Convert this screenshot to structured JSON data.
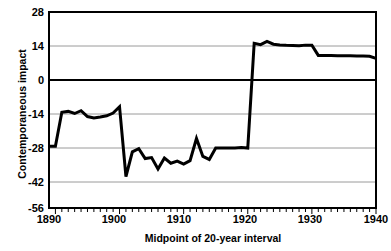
{
  "chart_data": {
    "type": "line",
    "title": "",
    "xlabel": "Midpoint of 20-year interval",
    "ylabel": "Contemporaneous impact",
    "xlim": [
      1889,
      1940
    ],
    "ylim": [
      -56,
      28
    ],
    "yticks": [
      28,
      14,
      0,
      -14,
      -28,
      -42,
      -56
    ],
    "xticks": [
      1890,
      1900,
      1910,
      1920,
      1930,
      1940
    ],
    "xtick_minor_step": 1,
    "grid": true,
    "legend": "none",
    "series": [
      {
        "name": "Contemporaneous impact",
        "x": [
          1889,
          1890,
          1891,
          1892,
          1893,
          1894,
          1895,
          1896,
          1897,
          1898,
          1899,
          1900,
          1901,
          1902,
          1903,
          1904,
          1905,
          1906,
          1907,
          1908,
          1909,
          1910,
          1911,
          1912,
          1913,
          1914,
          1915,
          1916,
          1917,
          1918,
          1919,
          1920,
          1921,
          1922,
          1923,
          1924,
          1925,
          1926,
          1927,
          1928,
          1929,
          1930,
          1931,
          1932,
          1933,
          1934,
          1935,
          1936,
          1937,
          1938,
          1939,
          1940
        ],
        "y": [
          -29.5,
          -29.5,
          -15.0,
          -14.6,
          -15.5,
          -14.3,
          -16.8,
          -17.4,
          -17.0,
          -16.5,
          -15.3,
          -12.6,
          -42.5,
          -31.9,
          -30.6,
          -34.8,
          -34.4,
          -39.3,
          -34.6,
          -36.8,
          -35.9,
          -37.2,
          -35.7,
          -26.2,
          -33.9,
          -35.2,
          -30.3,
          -30.3,
          -30.3,
          -30.3,
          -30.1,
          -30.3,
          14.6,
          14.0,
          15.4,
          14.2,
          13.9,
          13.7,
          13.6,
          13.5,
          13.8,
          13.8,
          9.4,
          9.4,
          9.4,
          9.3,
          9.2,
          9.2,
          9.1,
          9.1,
          9.0,
          8.1
        ]
      }
    ]
  },
  "axis": {
    "y_tick_labels": [
      "28",
      "14",
      "0",
      "-14",
      "-28",
      "-42",
      "-56"
    ],
    "x_tick_labels": [
      "1890",
      "1900",
      "1910",
      "1920",
      "1930",
      "1940"
    ],
    "y_title": "Contemporaneous impact",
    "x_title": "Midpoint of 20-year interval"
  },
  "colors": {
    "line": "#000000",
    "grid": "#808080",
    "frame": "#000000",
    "background": "#ffffff"
  }
}
